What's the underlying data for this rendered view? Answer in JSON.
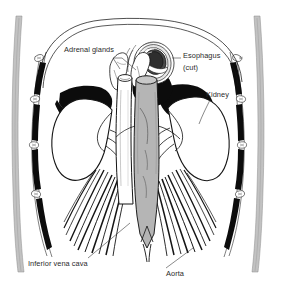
{
  "figure": {
    "kind": "anatomical-line-drawing",
    "width": 282,
    "height": 284,
    "background_color": "#ffffff",
    "ink_color": "#141414",
    "vessel_gray": "#b5b5b5",
    "bodywall_gray": "#bdbdbd",
    "label_color": "#2a2a2a"
  },
  "labels": {
    "adrenal_glands": "Adrenal glands",
    "esophagus_line1": "Esophagus",
    "esophagus_line2": "(cut)",
    "kidney": "Kidney",
    "inferior_vena_cava": "Inferior vena cava",
    "aorta": "Aorta"
  },
  "structures": [
    {
      "name": "adrenal-gland-left",
      "label": "Adrenal glands",
      "shading": "white-outline"
    },
    {
      "name": "adrenal-gland-right",
      "label": "Adrenal glands",
      "shading": "white-outline"
    },
    {
      "name": "esophagus-cut",
      "label": "Esophagus (cut)",
      "shading": "dark-ring"
    },
    {
      "name": "kidney-left",
      "label": "Kidney",
      "shading": "white-outline"
    },
    {
      "name": "kidney-right",
      "label": "Kidney",
      "shading": "white-outline"
    },
    {
      "name": "inferior-vena-cava",
      "label": "Inferior vena cava",
      "shading": "white-vessel"
    },
    {
      "name": "aorta",
      "label": "Aorta",
      "shading": "gray-vessel"
    },
    {
      "name": "diaphragm",
      "label": "Diaphragm",
      "shading": "solid-black"
    },
    {
      "name": "rib-cage-left",
      "label": "Ribs",
      "shading": "solid-black"
    },
    {
      "name": "rib-cage-right",
      "label": "Ribs",
      "shading": "solid-black"
    },
    {
      "name": "body-wall-left",
      "label": "Body wall",
      "shading": "gray-band"
    },
    {
      "name": "body-wall-right",
      "label": "Body wall",
      "shading": "gray-band"
    },
    {
      "name": "psoas-muscle-left",
      "label": "Muscle striations",
      "shading": "hatched"
    },
    {
      "name": "psoas-muscle-right",
      "label": "Muscle striations",
      "shading": "hatched"
    }
  ]
}
